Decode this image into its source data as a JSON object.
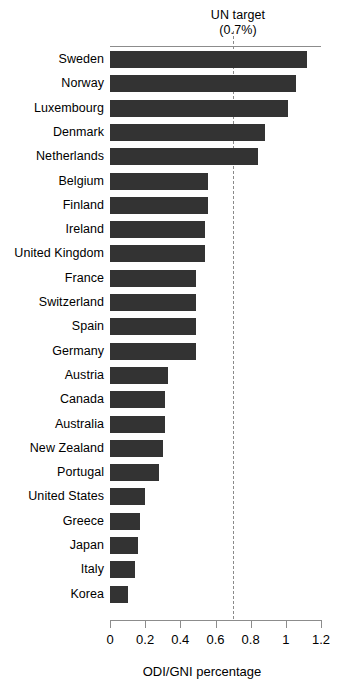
{
  "chart_data": {
    "type": "bar",
    "orientation": "horizontal",
    "title": "",
    "xlabel": "ODI/GNI percentage",
    "ylabel": "",
    "xlim": [
      0,
      1.2
    ],
    "xticks": [
      0,
      0.2,
      0.4,
      0.6,
      0.8,
      1,
      1.2
    ],
    "xtick_labels": [
      "0",
      "0.2",
      "0.4",
      "0.6",
      "0.8",
      "1",
      "1.2"
    ],
    "grid": false,
    "legend": "none",
    "bar_color": "#333333",
    "categories": [
      "Sweden",
      "Norway",
      "Luxembourg",
      "Denmark",
      "Netherlands",
      "Belgium",
      "Finland",
      "Ireland",
      "United Kingdom",
      "France",
      "Switzerland",
      "Spain",
      "Germany",
      "Austria",
      "Canada",
      "Australia",
      "New Zealand",
      "Portugal",
      "United States",
      "Greece",
      "Japan",
      "Italy",
      "Korea"
    ],
    "values": [
      1.12,
      1.06,
      1.01,
      0.88,
      0.84,
      0.56,
      0.56,
      0.54,
      0.54,
      0.49,
      0.49,
      0.49,
      0.49,
      0.33,
      0.31,
      0.31,
      0.3,
      0.28,
      0.2,
      0.17,
      0.16,
      0.14,
      0.1
    ],
    "annotations": [
      {
        "name": "un-target",
        "label_line1": "UN target",
        "label_line2": "(0.7%)",
        "value": 0.7,
        "style": "dashed-vertical-line",
        "color": "#8a8a8a"
      }
    ]
  }
}
